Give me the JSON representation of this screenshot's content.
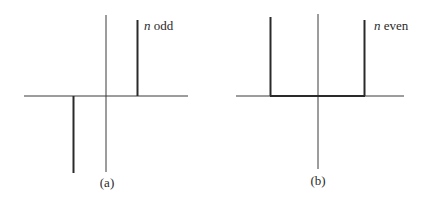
{
  "panels": [
    {
      "id": "a",
      "caption": "(a)",
      "label_var": "n",
      "label_text": " odd",
      "description": "Odd symmetry: positive impulse on right, negative impulse on left"
    },
    {
      "id": "b",
      "caption": "(b)",
      "label_var": "n",
      "label_text": " even",
      "description": "Even symmetry: two positive impulses joined by baseline"
    }
  ],
  "colors": {
    "axis": "#3a3a3a",
    "signal": "#2a2a2a",
    "background": "#ffffff"
  }
}
